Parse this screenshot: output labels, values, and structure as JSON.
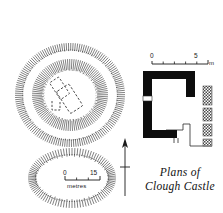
{
  "figure": {
    "caption_line1": "Plans of",
    "caption_line2": "Clough Castle",
    "background_color": "#ffffff",
    "ink_color": "#111111"
  },
  "scale_bars": [
    {
      "id": "castle-plan-scale",
      "min_label": "0",
      "max_label": "5",
      "unit_label": "m",
      "divisions": 5,
      "position": "top-right"
    },
    {
      "id": "earthwork-scale",
      "min_label": "0",
      "max_label": "15",
      "unit_label": "metres",
      "divisions": 3,
      "position": "lower-left"
    }
  ],
  "north_arrow": {
    "label": "",
    "direction": "up"
  },
  "plans": [
    {
      "id": "earthwork-plan",
      "name": "motte-and-bailey earthwork plan",
      "elements": [
        "outer-hachured-bank",
        "inner-hachured-bank",
        "motte-summit",
        "dashed-building-outline-large",
        "dashed-building-outline-small",
        "dashed-structure-u-shape",
        "bailey-hachured-enclosure"
      ]
    },
    {
      "id": "castle-plan",
      "name": "Clough Castle tower house plan",
      "elements": [
        "solid-masonry-wall",
        "stippled-wall-range",
        "thin-line-wall-foundation",
        "entrance-gap"
      ]
    }
  ]
}
